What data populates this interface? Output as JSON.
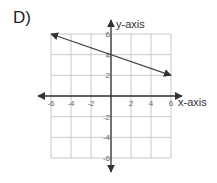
{
  "problem_label": "D)",
  "chart_data": {
    "type": "line",
    "title": "",
    "xlabel": "x-axis",
    "ylabel": "y-axis",
    "xlim": [
      -6,
      6
    ],
    "ylim": [
      -6,
      6
    ],
    "grid": true,
    "grid_step": 2,
    "x_ticks": [
      -6,
      -4,
      -2,
      2,
      4,
      6
    ],
    "y_ticks": [
      6,
      4,
      2,
      -2,
      -4,
      -6
    ],
    "x_tick_labels": [
      "-6",
      "-4",
      "-2",
      "2",
      "4",
      "6"
    ],
    "y_tick_labels": [
      "6",
      "4",
      "2",
      "-2",
      "-4",
      "-6"
    ],
    "series": [
      {
        "name": "line",
        "points": [
          [
            -6,
            6
          ],
          [
            6,
            2
          ]
        ],
        "arrows": "both"
      }
    ]
  }
}
